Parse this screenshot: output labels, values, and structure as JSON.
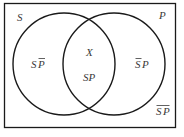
{
  "diagram": {
    "type": "venn",
    "universe_border": {
      "x": 4,
      "y": 3,
      "width": 172,
      "height": 125
    },
    "colors": {
      "stroke": "#1a1a1a",
      "text": "#3a3a3a",
      "background": "#ffffff"
    },
    "circles": [
      {
        "name": "S",
        "label": "S",
        "cx": 64,
        "cy": 64,
        "r": 51
      },
      {
        "name": "P",
        "label": "P",
        "cx": 114,
        "cy": 64,
        "r": 51
      }
    ],
    "regions": {
      "s_not_p": {
        "base": "SP",
        "bar_on": "P"
      },
      "s_and_p_mark": "X",
      "s_and_p": "SP",
      "not_s_p": {
        "base": "SP",
        "bar_on": "S"
      },
      "not_s_not_p": {
        "base": "SP",
        "bar_on": "both"
      }
    },
    "labels": {
      "S": "S",
      "P": "P",
      "S_letter": "S",
      "P_letter": "P",
      "X": "X"
    }
  }
}
